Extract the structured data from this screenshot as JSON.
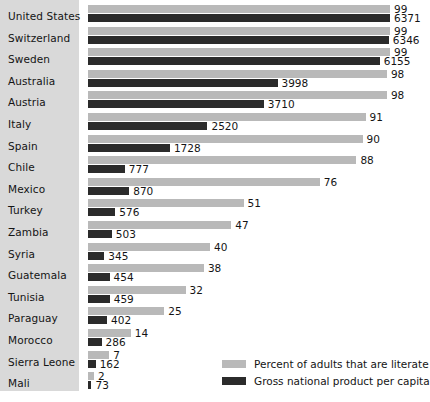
{
  "chart_data": {
    "type": "bar",
    "orientation": "horizontal",
    "title": "",
    "xlabel": "",
    "ylabel": "",
    "grid": false,
    "legend_position": "bottom-right",
    "categories": [
      "United States",
      "Switzerland",
      "Sweden",
      "Australia",
      "Austria",
      "Italy",
      "Spain",
      "Chile",
      "Mexico",
      "Turkey",
      "Zambia",
      "Syria",
      "Guatemala",
      "Tunisia",
      "Paraguay",
      "Morocco",
      "Sierra Leone",
      "Mali"
    ],
    "series": [
      {
        "name": "Percent of adults that are literate",
        "color": "#b9b9b9",
        "unit": "percent",
        "max": 99,
        "values": [
          99,
          99,
          99,
          98,
          98,
          91,
          90,
          88,
          76,
          51,
          47,
          40,
          38,
          32,
          25,
          14,
          7,
          2
        ]
      },
      {
        "name": "Gross national product per capita",
        "color": "#2b2b2b",
        "unit": "currency",
        "max": 6371,
        "values": [
          6371,
          6346,
          6155,
          3998,
          3710,
          2520,
          1728,
          777,
          870,
          576,
          503,
          345,
          454,
          459,
          402,
          286,
          162,
          73
        ]
      }
    ]
  },
  "legend": {
    "items": [
      {
        "label": "Percent of adults that are literate",
        "color": "#b9b9b9"
      },
      {
        "label": "Gross national product per capita",
        "color": "#2b2b2b"
      }
    ]
  },
  "colors": {
    "literacy_bar": "#b9b9b9",
    "gnp_bar": "#2b2b2b",
    "label_panel": "#d9d9d9",
    "background": "#ffffff",
    "text": "#141414"
  }
}
